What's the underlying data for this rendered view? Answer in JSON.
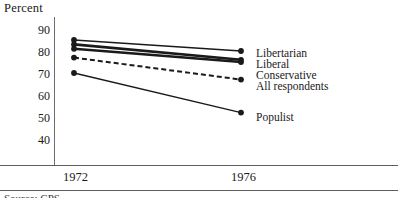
{
  "chart_data": {
    "type": "line",
    "title": "",
    "ylabel": "Percent",
    "xlabel": "",
    "x": [
      "1972",
      "1976"
    ],
    "ylim": [
      40,
      90
    ],
    "yticks": [
      90,
      80,
      70,
      60,
      50,
      40
    ],
    "grid": false,
    "legend_position": "right-inline-labels",
    "series": [
      {
        "name": "Libertarian",
        "values": [
          85,
          80
        ],
        "style": "thin-solid",
        "color": "#1a1a1a"
      },
      {
        "name": "Liberal",
        "values": [
          83,
          76
        ],
        "style": "thick-solid",
        "color": "#1a1a1a"
      },
      {
        "name": "Conservative",
        "values": [
          81,
          75
        ],
        "style": "thick-solid",
        "color": "#1a1a1a"
      },
      {
        "name": "All respondents",
        "values": [
          77,
          67
        ],
        "style": "dashed",
        "color": "#1a1a1a"
      },
      {
        "name": "Populist",
        "values": [
          70,
          52
        ],
        "style": "thin-solid",
        "color": "#1a1a1a"
      }
    ]
  },
  "axis": {
    "y_title": "Percent",
    "y_tick_labels": [
      "90",
      "80",
      "70",
      "60",
      "50",
      "40"
    ],
    "x_tick_labels": [
      "1972",
      "1976"
    ]
  },
  "labels": {
    "libertarian": "Libertarian",
    "liberal": "Liberal",
    "conservative": "Conservative",
    "all_respondents": "All respondents",
    "populist": "Populist"
  },
  "footer": {
    "source": "Source: CPS"
  }
}
